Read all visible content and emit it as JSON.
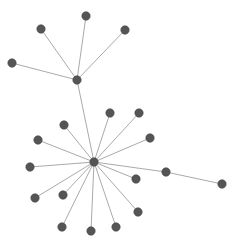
{
  "diagram": {
    "type": "network-graph",
    "width": 239,
    "height": 247,
    "colors": {
      "background": "#ffffff",
      "node_fill": "#555555",
      "node_stroke": "#444444",
      "edge": "#aaaaaa"
    },
    "node_radius": 4.2,
    "nodes": [
      {
        "id": "hub-top",
        "x": 77,
        "y": 80
      },
      {
        "id": "t1",
        "x": 12,
        "y": 63
      },
      {
        "id": "t2",
        "x": 41,
        "y": 29
      },
      {
        "id": "t3",
        "x": 86,
        "y": 16
      },
      {
        "id": "t4",
        "x": 125,
        "y": 30
      },
      {
        "id": "hub-bottom",
        "x": 94,
        "y": 162
      },
      {
        "id": "b1",
        "x": 110,
        "y": 113
      },
      {
        "id": "b2",
        "x": 139,
        "y": 113
      },
      {
        "id": "b3",
        "x": 150,
        "y": 138
      },
      {
        "id": "b4",
        "x": 166,
        "y": 172
      },
      {
        "id": "b5",
        "x": 222,
        "y": 184
      },
      {
        "id": "b6",
        "x": 136,
        "y": 179
      },
      {
        "id": "b7",
        "x": 138,
        "y": 212
      },
      {
        "id": "b8",
        "x": 116,
        "y": 227
      },
      {
        "id": "b9",
        "x": 91,
        "y": 231
      },
      {
        "id": "b10",
        "x": 62,
        "y": 227
      },
      {
        "id": "b11",
        "x": 63,
        "y": 195
      },
      {
        "id": "b12",
        "x": 35,
        "y": 198
      },
      {
        "id": "b13",
        "x": 30,
        "y": 167
      },
      {
        "id": "b14",
        "x": 38,
        "y": 140
      },
      {
        "id": "b15",
        "x": 64,
        "y": 125
      }
    ],
    "edges": [
      [
        "hub-top",
        "t1"
      ],
      [
        "hub-top",
        "t2"
      ],
      [
        "hub-top",
        "t3"
      ],
      [
        "hub-top",
        "t4"
      ],
      [
        "hub-top",
        "hub-bottom"
      ],
      [
        "hub-bottom",
        "b1"
      ],
      [
        "hub-bottom",
        "b2"
      ],
      [
        "hub-bottom",
        "b3"
      ],
      [
        "hub-bottom",
        "b4"
      ],
      [
        "b4",
        "b5"
      ],
      [
        "hub-bottom",
        "b6"
      ],
      [
        "hub-bottom",
        "b7"
      ],
      [
        "hub-bottom",
        "b8"
      ],
      [
        "hub-bottom",
        "b9"
      ],
      [
        "hub-bottom",
        "b10"
      ],
      [
        "hub-bottom",
        "b11"
      ],
      [
        "hub-bottom",
        "b12"
      ],
      [
        "hub-bottom",
        "b13"
      ],
      [
        "hub-bottom",
        "b14"
      ],
      [
        "hub-bottom",
        "b15"
      ]
    ]
  }
}
